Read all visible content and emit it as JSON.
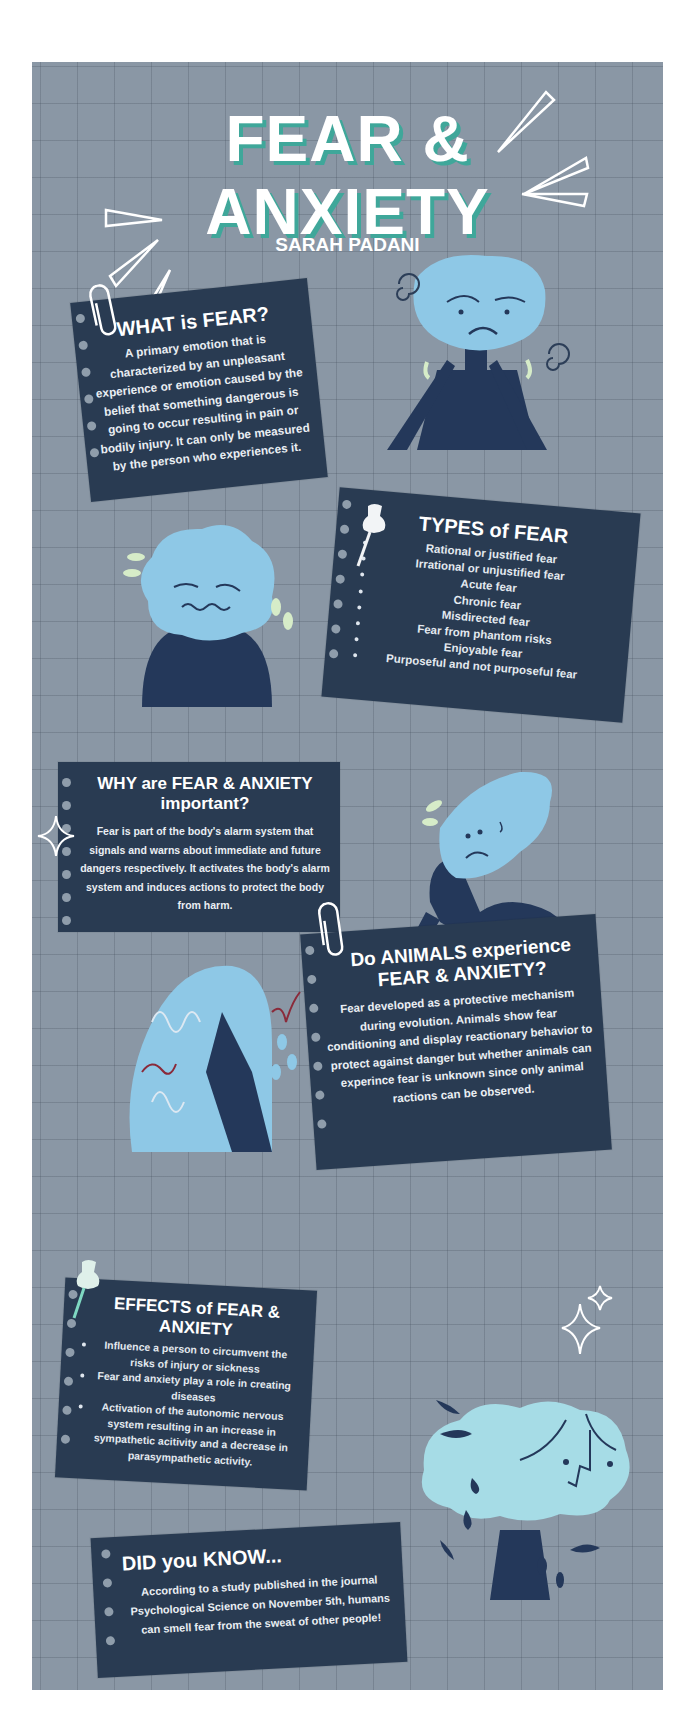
{
  "header": {
    "title_line1": "FEAR &",
    "title_line2": "ANXIETY",
    "author": "SARAH PADANI"
  },
  "sections": {
    "what_is_fear": {
      "heading": "WHAT is FEAR?",
      "body": "A primary emotion that is characterized by an unpleasant experience or emotion caused by the belief that something dangerous is going to occur resulting in pain or bodily injury. It can only be measured by the person who experiences it."
    },
    "types_of_fear": {
      "heading": "TYPES of FEAR",
      "items": [
        "Rational or justified fear",
        "Irrational or unjustified fear",
        "Acute fear",
        "Chronic fear",
        "Misdirected fear",
        "Fear from phantom risks",
        "Enjoyable fear",
        "Purposeful and not purposeful fear"
      ]
    },
    "why_important": {
      "heading_line1": "WHY are FEAR & ANXIETY",
      "heading_line2": "important?",
      "body": "Fear is part of the body's alarm system that signals and warns about immediate and future dangers respectively. It activates the body's alarm system and induces actions to protect the body from harm."
    },
    "animals": {
      "heading": "Do ANIMALS experience FEAR & ANXIETY?",
      "body": "Fear developed as a protective mechanism during evolution. Animals show fear conditioning and display reactionary behavior to protect against danger but whether animals can experince fear is unknown since only animal ractions can be observed."
    },
    "effects": {
      "heading": "EFFECTS of FEAR & ANXIETY",
      "items": [
        "Influence a person to circumvent the risks of injury or sickness",
        "Fear and anxiety play a role in creating diseases",
        "Activation of the autonomic nervous system resulting in an increase in sympathetic acitivity and a decrease in parasympathetic activity."
      ]
    },
    "did_you_know": {
      "heading": "DID you KNOW...",
      "body": "According to a study published in the journal Psychological Science on November 5th, humans can smell fear from the sweat of other people!"
    }
  },
  "colors": {
    "background": "#8a97a5",
    "card": "#293b52",
    "title_shadow": "#3fa79a",
    "figure_light": "#8ec8e6",
    "figure_dark": "#24385a",
    "tears": "#d6ecc8"
  }
}
